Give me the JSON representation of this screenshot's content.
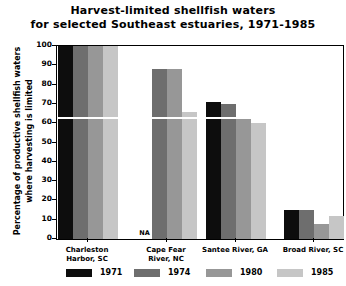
{
  "chart_data": {
    "type": "bar",
    "title": "Harvest-limited shellfish waters for selected Southeast estuaries, 1971-1985",
    "title_lines": [
      "Harvest-limited shellfish waters",
      "for selected Southeast estuaries, 1971-1985"
    ],
    "xlabel": "",
    "ylabel": "Percentage of productive shellfish waters where harvesting is limited",
    "ylabel_lines": [
      "Percentage of productive shellfish waters",
      "where harvesting is limited"
    ],
    "ylim": [
      0,
      100
    ],
    "ytick_labels": [
      "100",
      "90",
      "80",
      "70",
      "60",
      "50",
      "40",
      "30",
      "20",
      "10",
      "0"
    ],
    "ytick_values": [
      100,
      90,
      80,
      70,
      60,
      50,
      40,
      30,
      20,
      10,
      0
    ],
    "grid": true,
    "gridline_value": 63,
    "legend_position": "bottom",
    "categories": [
      "Charleston Harbor, SC",
      "Cape Fear River, NC",
      "Santee River, GA",
      "Broad River, SC"
    ],
    "category_label_lines": [
      [
        "Charleston",
        "Harbor, SC"
      ],
      [
        "Cape Fear",
        "River, NC"
      ],
      [
        "Santee River, GA",
        ""
      ],
      [
        "Broad River, SC",
        ""
      ]
    ],
    "series": [
      {
        "name": "1971",
        "color": "#0d0d0d",
        "values": [
          100,
          null,
          71,
          15
        ]
      },
      {
        "name": "1974",
        "color": "#6e6e6e",
        "values": [
          100,
          88,
          70,
          15
        ]
      },
      {
        "name": "1980",
        "color": "#979797",
        "values": [
          100,
          88,
          62,
          8
        ]
      },
      {
        "name": "1985",
        "color": "#c6c6c6",
        "values": [
          100,
          66,
          60,
          12
        ]
      }
    ],
    "missing_label": "NA",
    "missing_cells": [
      {
        "category": "Cape Fear River, NC",
        "series": "1971"
      }
    ]
  },
  "legend": {
    "entries": [
      {
        "label": "1971",
        "color": "#0d0d0d"
      },
      {
        "label": "1974",
        "color": "#6e6e6e"
      },
      {
        "label": "1980",
        "color": "#979797"
      },
      {
        "label": "1985",
        "color": "#c6c6c6"
      }
    ]
  },
  "colors": {
    "background": "#ffffff",
    "foreground": "#000000",
    "gridline": "#ffffff"
  }
}
